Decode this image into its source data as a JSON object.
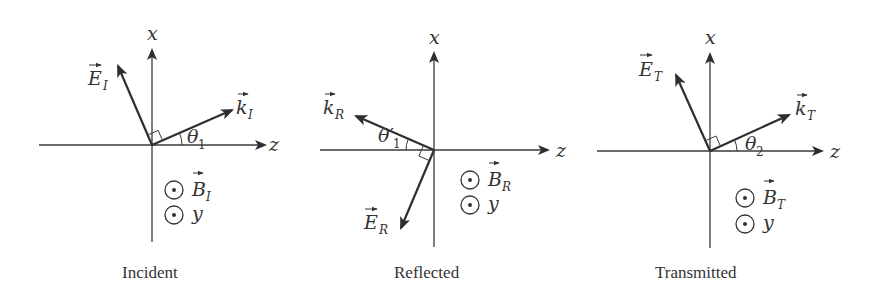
{
  "figure": {
    "panels": [
      {
        "id": "incident",
        "caption": "Incident",
        "axis_x_label": "x",
        "axis_z_label": "z",
        "e_vector": {
          "symbol": "E",
          "subscript": "I"
        },
        "k_vector": {
          "symbol": "k",
          "subscript": "I"
        },
        "b_vector": {
          "symbol": "B",
          "subscript": "I",
          "direction": "out-of-page"
        },
        "y_axis": {
          "label": "y",
          "direction": "out-of-page"
        },
        "angle": {
          "symbol": "θ",
          "subscript": "1"
        }
      },
      {
        "id": "reflected",
        "caption": "Reflected",
        "axis_x_label": "x",
        "axis_z_label": "z",
        "e_vector": {
          "symbol": "E",
          "subscript": "R"
        },
        "k_vector": {
          "symbol": "k",
          "subscript": "R"
        },
        "b_vector": {
          "symbol": "B",
          "subscript": "R",
          "direction": "out-of-page"
        },
        "y_axis": {
          "label": "y",
          "direction": "out-of-page"
        },
        "angle": {
          "symbol": "θ′",
          "subscript": "1"
        }
      },
      {
        "id": "transmitted",
        "caption": "Transmitted",
        "axis_x_label": "x",
        "axis_z_label": "z",
        "e_vector": {
          "symbol": "E",
          "subscript": "T"
        },
        "k_vector": {
          "symbol": "k",
          "subscript": "T"
        },
        "b_vector": {
          "symbol": "B",
          "subscript": "T",
          "direction": "out-of-page"
        },
        "y_axis": {
          "label": "y",
          "direction": "out-of-page"
        },
        "angle": {
          "symbol": "θ",
          "subscript": "2"
        }
      }
    ]
  },
  "colors": {
    "ink": "#333333",
    "background": "#ffffff"
  }
}
